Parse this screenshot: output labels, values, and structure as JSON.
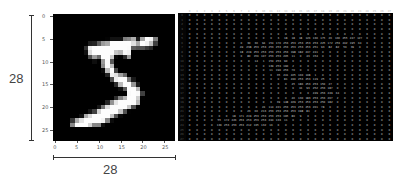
{
  "figure": {
    "height_label": "28",
    "width_label": "28",
    "x_ticks": [
      "0",
      "5",
      "10",
      "15",
      "20",
      "25"
    ],
    "y_ticks": [
      "0",
      "5",
      "10",
      "15",
      "20",
      "25"
    ],
    "digit_label": "5"
  },
  "pixels": [
    [
      0,
      0,
      0,
      0,
      0,
      0,
      0,
      0,
      0,
      0,
      0,
      0,
      0,
      0,
      0,
      0,
      0,
      0,
      0,
      0,
      0,
      0,
      0,
      0,
      0,
      0,
      0,
      0
    ],
    [
      0,
      0,
      0,
      0,
      0,
      0,
      0,
      0,
      0,
      0,
      0,
      0,
      0,
      0,
      0,
      0,
      0,
      0,
      0,
      0,
      0,
      0,
      0,
      0,
      0,
      0,
      0,
      0
    ],
    [
      0,
      0,
      0,
      0,
      0,
      0,
      0,
      0,
      0,
      0,
      0,
      0,
      0,
      0,
      0,
      0,
      0,
      0,
      0,
      0,
      0,
      0,
      0,
      0,
      0,
      0,
      0,
      0
    ],
    [
      0,
      0,
      0,
      0,
      0,
      0,
      0,
      0,
      0,
      0,
      0,
      0,
      0,
      0,
      0,
      0,
      0,
      0,
      0,
      0,
      0,
      0,
      0,
      0,
      0,
      0,
      0,
      0
    ],
    [
      0,
      0,
      0,
      0,
      0,
      0,
      0,
      0,
      0,
      0,
      0,
      0,
      0,
      0,
      0,
      0,
      0,
      0,
      0,
      0,
      0,
      0,
      0,
      0,
      0,
      0,
      0,
      0
    ],
    [
      0,
      0,
      0,
      0,
      0,
      0,
      0,
      0,
      0,
      0,
      0,
      0,
      3,
      18,
      18,
      18,
      126,
      136,
      175,
      26,
      166,
      255,
      247,
      127,
      0,
      0,
      0,
      0
    ],
    [
      0,
      0,
      0,
      0,
      0,
      0,
      0,
      0,
      30,
      36,
      94,
      154,
      170,
      253,
      253,
      253,
      253,
      253,
      225,
      172,
      253,
      242,
      195,
      64,
      0,
      0,
      0,
      0
    ],
    [
      0,
      0,
      0,
      0,
      0,
      0,
      0,
      49,
      238,
      253,
      253,
      253,
      253,
      253,
      253,
      253,
      253,
      251,
      93,
      82,
      82,
      56,
      39,
      0,
      0,
      0,
      0,
      0
    ],
    [
      0,
      0,
      0,
      0,
      0,
      0,
      0,
      18,
      219,
      253,
      253,
      253,
      253,
      253,
      198,
      182,
      247,
      241,
      0,
      0,
      0,
      0,
      0,
      0,
      0,
      0,
      0,
      0
    ],
    [
      0,
      0,
      0,
      0,
      0,
      0,
      0,
      0,
      80,
      156,
      107,
      253,
      253,
      205,
      11,
      0,
      43,
      154,
      0,
      0,
      0,
      0,
      0,
      0,
      0,
      0,
      0,
      0
    ],
    [
      0,
      0,
      0,
      0,
      0,
      0,
      0,
      0,
      0,
      14,
      1,
      154,
      253,
      90,
      0,
      0,
      0,
      0,
      0,
      0,
      0,
      0,
      0,
      0,
      0,
      0,
      0,
      0
    ],
    [
      0,
      0,
      0,
      0,
      0,
      0,
      0,
      0,
      0,
      0,
      0,
      139,
      253,
      190,
      2,
      0,
      0,
      0,
      0,
      0,
      0,
      0,
      0,
      0,
      0,
      0,
      0,
      0
    ],
    [
      0,
      0,
      0,
      0,
      0,
      0,
      0,
      0,
      0,
      0,
      0,
      11,
      190,
      253,
      70,
      0,
      0,
      0,
      0,
      0,
      0,
      0,
      0,
      0,
      0,
      0,
      0,
      0
    ],
    [
      0,
      0,
      0,
      0,
      0,
      0,
      0,
      0,
      0,
      0,
      0,
      0,
      35,
      241,
      225,
      160,
      108,
      1,
      0,
      0,
      0,
      0,
      0,
      0,
      0,
      0,
      0,
      0
    ],
    [
      0,
      0,
      0,
      0,
      0,
      0,
      0,
      0,
      0,
      0,
      0,
      0,
      0,
      81,
      240,
      253,
      253,
      119,
      25,
      0,
      0,
      0,
      0,
      0,
      0,
      0,
      0,
      0
    ],
    [
      0,
      0,
      0,
      0,
      0,
      0,
      0,
      0,
      0,
      0,
      0,
      0,
      0,
      0,
      45,
      186,
      253,
      253,
      150,
      27,
      0,
      0,
      0,
      0,
      0,
      0,
      0,
      0
    ],
    [
      0,
      0,
      0,
      0,
      0,
      0,
      0,
      0,
      0,
      0,
      0,
      0,
      0,
      0,
      0,
      16,
      93,
      252,
      253,
      187,
      0,
      0,
      0,
      0,
      0,
      0,
      0,
      0
    ],
    [
      0,
      0,
      0,
      0,
      0,
      0,
      0,
      0,
      0,
      0,
      0,
      0,
      0,
      0,
      0,
      0,
      0,
      249,
      253,
      249,
      64,
      0,
      0,
      0,
      0,
      0,
      0,
      0
    ],
    [
      0,
      0,
      0,
      0,
      0,
      0,
      0,
      0,
      0,
      0,
      0,
      0,
      0,
      0,
      46,
      130,
      183,
      253,
      253,
      207,
      2,
      0,
      0,
      0,
      0,
      0,
      0,
      0
    ],
    [
      0,
      0,
      0,
      0,
      0,
      0,
      0,
      0,
      0,
      0,
      0,
      0,
      39,
      148,
      229,
      253,
      253,
      253,
      250,
      182,
      0,
      0,
      0,
      0,
      0,
      0,
      0,
      0
    ],
    [
      0,
      0,
      0,
      0,
      0,
      0,
      0,
      0,
      0,
      0,
      24,
      114,
      221,
      253,
      253,
      253,
      253,
      201,
      78,
      0,
      0,
      0,
      0,
      0,
      0,
      0,
      0,
      0
    ],
    [
      0,
      0,
      0,
      0,
      0,
      0,
      0,
      0,
      23,
      66,
      213,
      253,
      253,
      253,
      253,
      198,
      81,
      2,
      0,
      0,
      0,
      0,
      0,
      0,
      0,
      0,
      0,
      0
    ],
    [
      0,
      0,
      0,
      0,
      0,
      0,
      18,
      171,
      219,
      253,
      253,
      253,
      253,
      195,
      80,
      9,
      0,
      0,
      0,
      0,
      0,
      0,
      0,
      0,
      0,
      0,
      0,
      0
    ],
    [
      0,
      0,
      0,
      0,
      55,
      172,
      226,
      253,
      253,
      253,
      253,
      244,
      133,
      11,
      0,
      0,
      0,
      0,
      0,
      0,
      0,
      0,
      0,
      0,
      0,
      0,
      0,
      0
    ],
    [
      0,
      0,
      0,
      0,
      136,
      253,
      253,
      253,
      212,
      135,
      132,
      16,
      0,
      0,
      0,
      0,
      0,
      0,
      0,
      0,
      0,
      0,
      0,
      0,
      0,
      0,
      0,
      0
    ],
    [
      0,
      0,
      0,
      0,
      0,
      0,
      0,
      0,
      0,
      0,
      0,
      0,
      0,
      0,
      0,
      0,
      0,
      0,
      0,
      0,
      0,
      0,
      0,
      0,
      0,
      0,
      0,
      0
    ],
    [
      0,
      0,
      0,
      0,
      0,
      0,
      0,
      0,
      0,
      0,
      0,
      0,
      0,
      0,
      0,
      0,
      0,
      0,
      0,
      0,
      0,
      0,
      0,
      0,
      0,
      0,
      0,
      0
    ],
    [
      0,
      0,
      0,
      0,
      0,
      0,
      0,
      0,
      0,
      0,
      0,
      0,
      0,
      0,
      0,
      0,
      0,
      0,
      0,
      0,
      0,
      0,
      0,
      0,
      0,
      0,
      0,
      0
    ]
  ]
}
